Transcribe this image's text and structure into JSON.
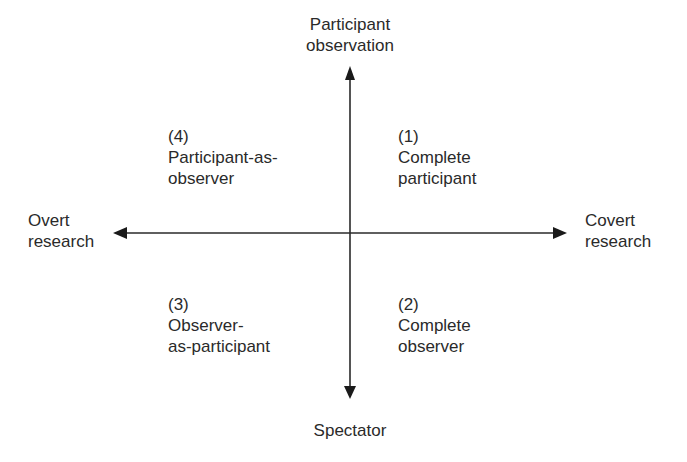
{
  "axes": {
    "top": [
      "Participant",
      "observation"
    ],
    "bottom": "Spectator",
    "left": [
      "Overt",
      "research"
    ],
    "right": [
      "Covert",
      "research"
    ]
  },
  "quadrants": {
    "q1": {
      "number": "(1)",
      "lines": [
        "Complete",
        "participant"
      ]
    },
    "q2": {
      "number": "(2)",
      "lines": [
        "Complete",
        "observer"
      ]
    },
    "q3": {
      "number": "(3)",
      "lines": [
        "Observer-",
        "as-participant"
      ]
    },
    "q4": {
      "number": "(4)",
      "lines": [
        "Participant-as-",
        "observer"
      ]
    }
  },
  "colors": {
    "ink": "#2a2a2a",
    "background": "#ffffff"
  }
}
